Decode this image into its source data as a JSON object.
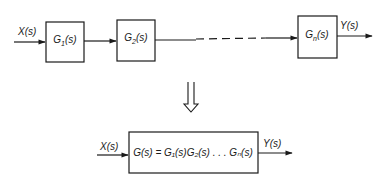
{
  "top_chain": {
    "input_label": "X(s)",
    "blocks": [
      {
        "label": "G",
        "sub": "1",
        "arg": "(s)"
      },
      {
        "label": "G",
        "sub": "2",
        "arg": "(s)"
      },
      {
        "label": "G",
        "sub": "n",
        "arg": "(s)"
      }
    ],
    "output_label": "Y(s)"
  },
  "transform_arrow": "hollow-down-arrow",
  "equivalent": {
    "input_label": "X(s)",
    "block_label": "G(s) = G₁(s)G₂(s) . . . Gₙ(s)",
    "output_label": "Y(s)"
  }
}
